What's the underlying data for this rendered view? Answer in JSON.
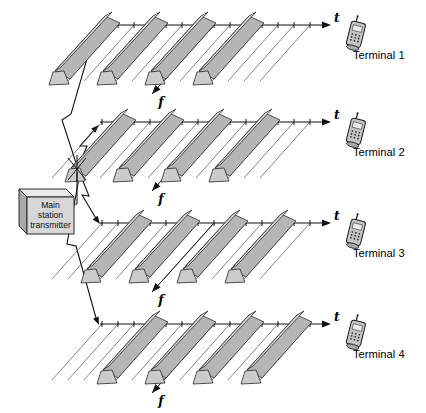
{
  "figure": {
    "transmitter": {
      "label_lines": [
        "Main",
        "station",
        "transmitter"
      ]
    },
    "axis_labels": {
      "time": "t",
      "frequency": "f"
    },
    "rows": [
      {
        "terminal": "Terminal 1",
        "bar_slots": [
          0,
          3,
          6,
          9
        ]
      },
      {
        "terminal": "Terminal 2",
        "bar_slots": [
          1,
          4,
          7,
          10
        ]
      },
      {
        "terminal": "Terminal 3",
        "bar_slots": [
          2,
          5,
          8,
          11
        ]
      },
      {
        "terminal": "Terminal 4",
        "bar_slots": [
          3,
          6,
          9,
          12
        ]
      }
    ],
    "icons": {
      "terminal_device": "mobile-phone-icon",
      "transmit_path": "lightning-bolt-icon",
      "transmitter_antenna": "antenna-icon"
    },
    "colors": {
      "bar_front": "#b5b5b5",
      "bar_top": "#dbdbdb",
      "bar_cap": "#cbcbcb",
      "outline": "#2b2b2b",
      "box_front": "#d7d7d7",
      "box_top": "#eaeaea",
      "box_side": "#a8a8a8",
      "thin_line": "#5a5a5a"
    }
  }
}
